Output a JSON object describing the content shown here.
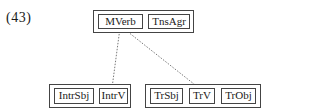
{
  "example_number": "(43)",
  "top_group": {
    "items": [
      "MVerb",
      "TnsAgr"
    ]
  },
  "bottom_left_group": {
    "items": [
      "IntrSbj",
      "IntrV"
    ]
  },
  "bottom_right_group": {
    "items": [
      "TrSbj",
      "TrV",
      "TrObj"
    ]
  },
  "links": [
    {
      "from": "MVerb",
      "to": "IntrV",
      "style": "dashed"
    },
    {
      "from": "MVerb",
      "to": "TrV",
      "style": "dashed"
    }
  ]
}
